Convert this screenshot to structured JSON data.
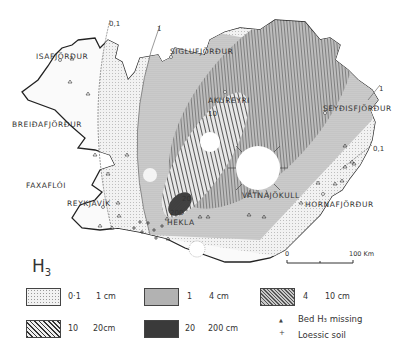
{
  "map": {
    "title": "H",
    "title_sub": "3",
    "places": [
      {
        "name": "ISAFJÖRÐUR",
        "x": 36,
        "y": 52
      },
      {
        "name": "SIGLUFJÖRÐUR",
        "x": 170,
        "y": 47
      },
      {
        "name": "AKUREYRI",
        "x": 208,
        "y": 96
      },
      {
        "name": "SEYÐISFJÖRÐUR",
        "x": 323,
        "y": 104
      },
      {
        "name": "BREIÐAFJÖRÐUR",
        "x": 12,
        "y": 120
      },
      {
        "name": "FAXAFLÓI",
        "x": 26,
        "y": 181
      },
      {
        "name": "REYKJAVÍK",
        "x": 67,
        "y": 199
      },
      {
        "name": "VATNAJÖKULL",
        "x": 242,
        "y": 191
      },
      {
        "name": "HORNAFJÖRÐUR",
        "x": 305,
        "y": 200
      },
      {
        "name": "HEKLA",
        "x": 167,
        "y": 218
      }
    ],
    "isopach_labels": [
      {
        "text": "0,1",
        "x": 109,
        "y": 20
      },
      {
        "text": "1",
        "x": 157,
        "y": 25
      },
      {
        "text": "1",
        "x": 379,
        "y": 85
      },
      {
        "text": "0,1",
        "x": 373,
        "y": 145
      },
      {
        "text": "10",
        "x": 208,
        "y": 110
      },
      {
        "text": "20",
        "x": 182,
        "y": 195
      },
      {
        "text": "200",
        "x": 170,
        "y": 209
      }
    ],
    "scale": {
      "start": "0",
      "end": "100 Km"
    }
  },
  "legend": {
    "items": [
      {
        "from": "0·1",
        "to": "1 cm",
        "pattern": "dots-light"
      },
      {
        "from": "1",
        "to": "4 cm",
        "pattern": "dots-medium"
      },
      {
        "from": "4",
        "to": "10 cm",
        "pattern": "hatch-fine"
      },
      {
        "from": "10",
        "to": "20cm",
        "pattern": "hatch-coarse"
      },
      {
        "from": "20",
        "to": "200 cm",
        "pattern": "dark"
      }
    ],
    "symbols": [
      {
        "glyph": "▲",
        "label": "Bed  H₃ missing"
      },
      {
        "glyph": "+",
        "label": "Loessic soil"
      }
    ]
  }
}
